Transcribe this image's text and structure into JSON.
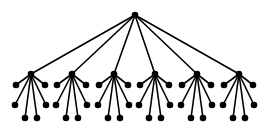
{
  "diagram": {
    "type": "tree",
    "width": 266,
    "height": 129,
    "colors": {
      "edge": "#000000",
      "node": "#000000",
      "background": "#ffffff"
    },
    "node_radius": 3.3,
    "root": {
      "id": "root",
      "x": 135,
      "y": 15
    },
    "level1_y": 74,
    "level1_x": [
      31,
      72,
      114,
      155,
      197,
      239
    ],
    "leaf_offsets": [
      {
        "dx": -15,
        "dy": 11
      },
      {
        "dx": 14,
        "dy": 11
      },
      {
        "dx": -16,
        "dy": 31
      },
      {
        "dx": 15,
        "dy": 31
      },
      {
        "dx": -6,
        "dy": 44
      },
      {
        "dx": 6,
        "dy": 44
      }
    ],
    "counts": {
      "root": 1,
      "level1": 6,
      "leaves_per_parent": 6,
      "total_nodes": 43
    }
  }
}
